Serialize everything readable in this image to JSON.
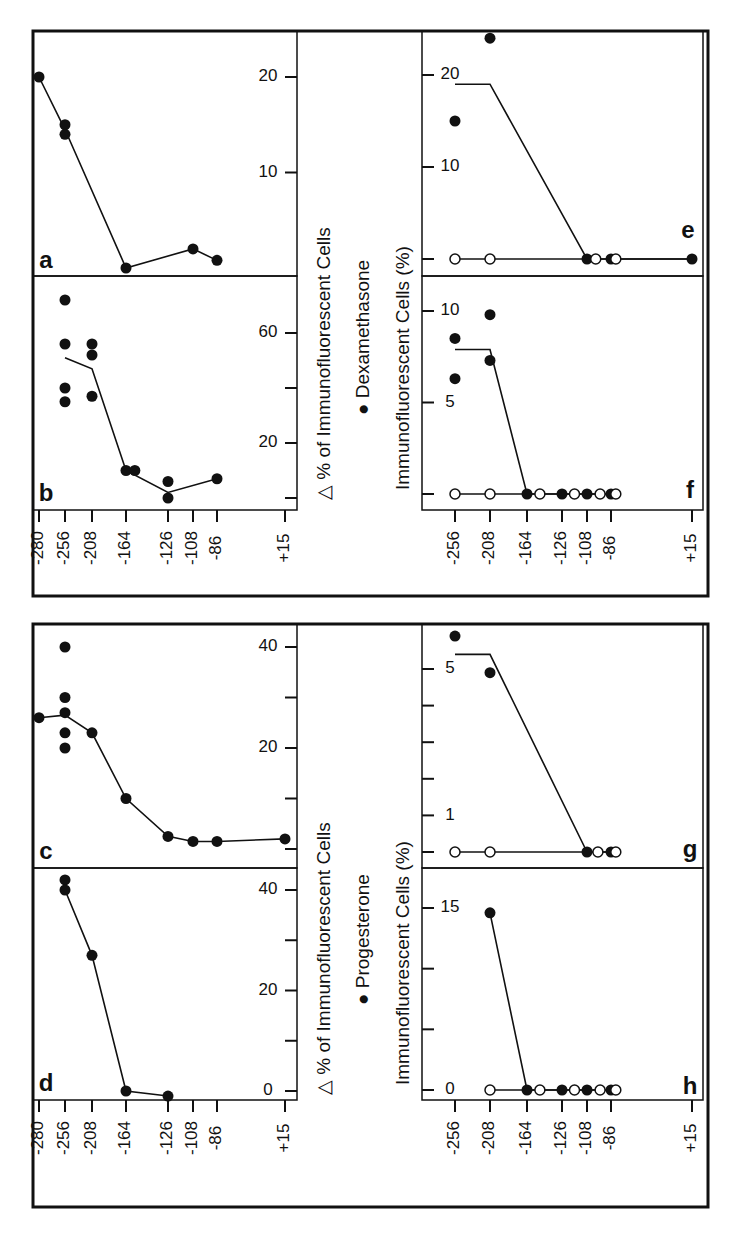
{
  "figure": {
    "frame_color": "#111111",
    "background": "#ffffff",
    "orientation": "rotated 90 degrees counter-clockwise",
    "groups": [
      {
        "id": "dexamethasone",
        "legend": "● Dexamethasone",
        "left_axis_title": "△ % of Immunofluorescent Cells",
        "right_axis_title": "Immunofluorescent Cells (%)"
      },
      {
        "id": "progesterone",
        "legend": "● Progesterone",
        "left_axis_title": "△ % of Immunofluorescent Cells",
        "right_axis_title": "Immunofluorescent Cells (%)"
      }
    ],
    "x_ticks_left": [
      "-280",
      "-256",
      "-208",
      "-164",
      "-126",
      "-108",
      "-86",
      "+15"
    ],
    "x_ticks_left_d": [
      "-280",
      "-256",
      "-208",
      "-164",
      "-126",
      "-108",
      "-86",
      "+15"
    ],
    "x_ticks_right": [
      "-256",
      "-208",
      "-164",
      "-126",
      "-108",
      "-86",
      "+15"
    ]
  },
  "chart_data": [
    {
      "panel": "a",
      "group": "Dexamethasone",
      "type": "line",
      "ylabel": "△ % of Immunofluorescent Cells",
      "xlabel": "5' deletion endpoint",
      "yticks": [
        10,
        20
      ],
      "ylim": [
        0,
        24
      ],
      "x": [
        -280,
        -256,
        -256,
        -164,
        -108,
        -86
      ],
      "values": [
        20,
        15,
        14,
        0,
        2,
        0.8
      ],
      "line": [
        [
          -280,
          20
        ],
        [
          -256,
          14.5
        ],
        [
          -164,
          0
        ],
        [
          -108,
          2
        ],
        [
          -86,
          0.8
        ]
      ]
    },
    {
      "panel": "b",
      "group": "Dexamethasone",
      "type": "scatter+line",
      "ylabel": "△ % of Immunofluorescent Cells",
      "yticks": [
        0,
        20,
        40,
        60
      ],
      "ytick_labels": [
        "",
        "20",
        "",
        "60"
      ],
      "ylim": [
        -3,
        80
      ],
      "points": [
        [
          -256,
          72
        ],
        [
          -256,
          56
        ],
        [
          -256,
          40
        ],
        [
          -256,
          35
        ],
        [
          -208,
          56
        ],
        [
          -208,
          52
        ],
        [
          -208,
          37
        ],
        [
          -164,
          10
        ],
        [
          -156,
          10
        ],
        [
          -126,
          6
        ],
        [
          -126,
          0
        ],
        [
          -86,
          7
        ]
      ],
      "line": [
        [
          -256,
          51
        ],
        [
          -208,
          47
        ],
        [
          -164,
          10
        ],
        [
          -126,
          2
        ],
        [
          -86,
          7
        ]
      ]
    },
    {
      "panel": "c",
      "group": "Progesterone",
      "type": "scatter+line",
      "ylabel": "△ % of Immunofluorescent Cells",
      "yticks": [
        0,
        10,
        20,
        30,
        40
      ],
      "ytick_labels": [
        "",
        "",
        "20",
        "",
        "40"
      ],
      "ylim": [
        -4,
        45
      ],
      "points": [
        [
          -280,
          26
        ],
        [
          -256,
          40
        ],
        [
          -256,
          30
        ],
        [
          -256,
          27
        ],
        [
          -256,
          23
        ],
        [
          -256,
          20
        ],
        [
          -208,
          23
        ],
        [
          -164,
          10
        ],
        [
          -126,
          2.5
        ],
        [
          -108,
          1.5
        ],
        [
          -86,
          1.5
        ],
        [
          15,
          2
        ]
      ],
      "line": [
        [
          -280,
          26
        ],
        [
          -256,
          26.5
        ],
        [
          -208,
          23
        ],
        [
          -164,
          10
        ],
        [
          -126,
          2.5
        ],
        [
          -108,
          1.5
        ],
        [
          -86,
          1.5
        ],
        [
          15,
          2
        ]
      ]
    },
    {
      "panel": "d",
      "group": "Progesterone",
      "type": "line",
      "ylabel": "△ % of Immunofluorescent Cells",
      "yticks": [
        0,
        10,
        20,
        30,
        40
      ],
      "ytick_labels": [
        "0",
        "",
        "20",
        "",
        "40"
      ],
      "ylim": [
        -3,
        44
      ],
      "points": [
        [
          -256,
          42
        ],
        [
          -256,
          40
        ],
        [
          -208,
          27
        ],
        [
          -164,
          0
        ],
        [
          -126,
          -1
        ]
      ],
      "line": [
        [
          -256,
          40
        ],
        [
          -208,
          27
        ],
        [
          -164,
          0
        ],
        [
          -126,
          -1
        ]
      ]
    },
    {
      "panel": "e",
      "group": "Dexamethasone",
      "type": "scatter+line",
      "ylabel": "Immunofluorescent Cells (%)",
      "yticks": [
        0,
        10,
        20
      ],
      "ytick_labels": [
        "",
        "10",
        "20"
      ],
      "ylim": [
        -2,
        27
      ],
      "filled_points": [
        [
          -256,
          15
        ],
        [
          -208,
          24
        ],
        [
          -108,
          0
        ],
        [
          -86,
          0
        ],
        [
          15,
          0
        ]
      ],
      "open_points": [
        [
          -256,
          0
        ],
        [
          -208,
          0
        ],
        [
          -100,
          0
        ],
        [
          -80,
          0
        ]
      ],
      "line_filled": [
        [
          -256,
          19
        ],
        [
          -208,
          19
        ],
        [
          -108,
          0
        ],
        [
          15,
          0
        ]
      ],
      "line_open": [
        [
          -256,
          0
        ],
        [
          15,
          0
        ]
      ]
    },
    {
      "panel": "f",
      "group": "Dexamethasone",
      "type": "scatter+line",
      "ylabel": "Immunofluorescent Cells (%)",
      "yticks": [
        0,
        5,
        10
      ],
      "ytick_labels": [
        "",
        "5",
        "10"
      ],
      "ylim": [
        -1,
        11
      ],
      "filled_points": [
        [
          -256,
          8.5
        ],
        [
          -256,
          6.3
        ],
        [
          -208,
          9.8
        ],
        [
          -208,
          7.3
        ],
        [
          -164,
          0
        ],
        [
          -126,
          0
        ],
        [
          -108,
          0
        ],
        [
          -86,
          0
        ]
      ],
      "open_points": [
        [
          -256,
          0
        ],
        [
          -208,
          0
        ],
        [
          -150,
          0
        ],
        [
          -117,
          0
        ],
        [
          -96,
          0
        ],
        [
          -80,
          0
        ]
      ],
      "line_filled": [
        [
          -256,
          7.9
        ],
        [
          -208,
          7.9
        ],
        [
          -164,
          0
        ],
        [
          -86,
          0
        ]
      ],
      "line_open": [
        [
          -256,
          0
        ],
        [
          -80,
          0
        ]
      ]
    },
    {
      "panel": "g",
      "group": "Progesterone",
      "type": "scatter+line",
      "ylabel": "Immunofluorescent Cells (%)",
      "yticks": [
        0,
        1,
        2,
        3,
        4,
        5
      ],
      "ytick_labels": [
        "",
        "1",
        "",
        "",
        "",
        "5"
      ],
      "ylim": [
        -0.5,
        6
      ],
      "filled_points": [
        [
          -256,
          5.9
        ],
        [
          -208,
          4.9
        ],
        [
          -108,
          0
        ],
        [
          -86,
          0
        ]
      ],
      "open_points": [
        [
          -256,
          0
        ],
        [
          -208,
          0
        ],
        [
          -98,
          0
        ],
        [
          -80,
          0
        ]
      ],
      "line_filled": [
        [
          -256,
          5.4
        ],
        [
          -208,
          5.4
        ],
        [
          -108,
          0
        ],
        [
          -80,
          0
        ]
      ],
      "line_open": [
        [
          -256,
          0
        ],
        [
          -80,
          0
        ]
      ]
    },
    {
      "panel": "h",
      "group": "Progesterone",
      "type": "scatter+line",
      "ylabel": "Immunofluorescent Cells (%)",
      "yticks": [
        0,
        5,
        10,
        15
      ],
      "ytick_labels": [
        "0",
        "",
        "",
        "15"
      ],
      "ylim": [
        -1,
        17
      ],
      "filled_points": [
        [
          -208,
          14.6
        ],
        [
          -164,
          0
        ],
        [
          -126,
          0
        ],
        [
          -108,
          0
        ],
        [
          -86,
          0
        ]
      ],
      "open_points": [
        [
          -208,
          0
        ],
        [
          -150,
          0
        ],
        [
          -117,
          0
        ],
        [
          -96,
          0
        ],
        [
          -80,
          0
        ]
      ],
      "line_filled": [
        [
          -208,
          14.6
        ],
        [
          -164,
          0
        ],
        [
          -80,
          0
        ]
      ],
      "line_open": [
        [
          -208,
          0
        ],
        [
          -80,
          0
        ]
      ]
    }
  ]
}
